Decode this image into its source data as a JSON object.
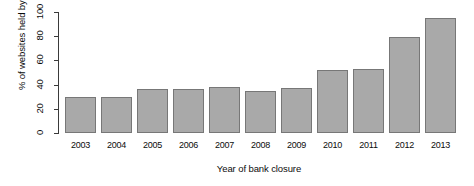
{
  "chart_data": {
    "type": "bar",
    "title": "",
    "xlabel": "Year of bank closure",
    "ylabel": "% of websites held by banks",
    "categories": [
      "2003",
      "2004",
      "2005",
      "2006",
      "2007",
      "2008",
      "2009",
      "2010",
      "2011",
      "2012",
      "2013"
    ],
    "values": [
      30,
      30,
      36,
      36,
      38,
      35,
      37,
      52,
      53,
      79,
      95
    ],
    "ylim": [
      0,
      100
    ],
    "yticks": [
      0,
      20,
      40,
      60,
      80,
      100
    ],
    "ytick_labels": [
      "0",
      "20",
      "40",
      "60",
      "80",
      "100"
    ],
    "grid": false,
    "legend": "none",
    "bar_fill_color": "#a9a9a9",
    "bar_border_color": "#777777",
    "axis_color": "#3a3a3a",
    "text_color": "#0c0c0c"
  }
}
